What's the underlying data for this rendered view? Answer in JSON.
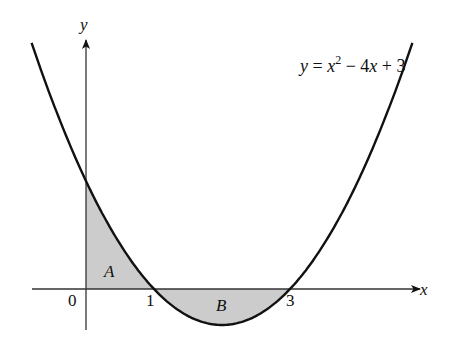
{
  "chart_data": {
    "type": "line",
    "title": "",
    "function": "y = x^2 - 4x + 3",
    "equation_label": {
      "y": "y",
      "eq": " = ",
      "x1": "x",
      "sup": "2",
      "rest": " − 4",
      "x2": "x",
      "tail": " + 3"
    },
    "xlabel": "x",
    "ylabel": "y",
    "x_ticks": [
      {
        "value": 0,
        "label": "0"
      },
      {
        "value": 1,
        "label": "1"
      },
      {
        "value": 3,
        "label": "3"
      }
    ],
    "roots": [
      1,
      3
    ],
    "y_intercept": 3,
    "vertex": [
      2,
      -1
    ],
    "xlim": [
      -0.8,
      4.8
    ],
    "regions": [
      {
        "label": "A",
        "description": "area between curve and x-axis for 0 ≤ x ≤ 1",
        "from": 0,
        "to": 1,
        "fill": "#cccccc"
      },
      {
        "label": "B",
        "description": "area between curve and x-axis for 1 ≤ x ≤ 3",
        "from": 1,
        "to": 3,
        "fill": "#cccccc"
      }
    ]
  },
  "colors": {
    "curve": "#111111",
    "axis": "#333333",
    "shade": "#cfcfcf"
  }
}
